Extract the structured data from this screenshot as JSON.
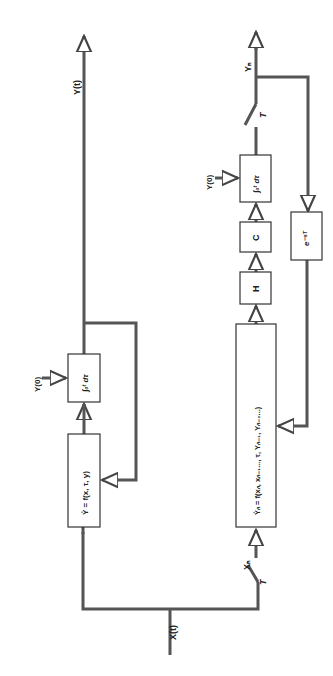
{
  "diagram": {
    "continuous": {
      "input_label": "X(t)",
      "output_label": "Y(t)",
      "function_block": "Y̊ = f(x, τ, y)",
      "integrator_block": "∫₀ᵗ dτ",
      "initial_condition": "Y(0)"
    },
    "discrete": {
      "input_label": "Xₙ",
      "sampler_label": "T",
      "output_label": "Yₙ",
      "output_sampler_label": "T",
      "function_block": "Y̊ₙ = f(xₙ, xₙ₋₁..., τ, Yₙ₋₁, Yₙ₋₂...)",
      "hold_block": "H",
      "c_block": "C",
      "integrator_block": "∫₀ᵗ dτ",
      "initial_condition": "Y(0)",
      "delay_block": "e⁻ˢᵀ"
    },
    "colors": {
      "line": "#555555",
      "box": "#333333",
      "background": "#ffffff"
    }
  }
}
